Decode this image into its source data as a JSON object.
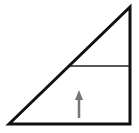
{
  "diagram": {
    "type": "right-triangle-with-divider",
    "background": "#ffffff",
    "stroke_color": "#111111",
    "divider_color": "#222222",
    "arrow_color": "#777777",
    "triangle": {
      "points": [
        [
          9,
          124
        ],
        [
          130,
          7
        ],
        [
          130,
          124
        ]
      ]
    },
    "divider": {
      "x1": 70,
      "y1": 66,
      "x2": 130,
      "y2": 66
    },
    "arrow": {
      "direction": "up",
      "x": 79,
      "y_top": 90,
      "y_bottom": 118
    }
  }
}
